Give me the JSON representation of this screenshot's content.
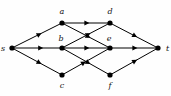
{
  "figure": {
    "name": "directed-flow-network-graph",
    "type": "directed-graph",
    "width": 171,
    "height": 96,
    "background_color": "#fefefe",
    "node_color": "#000000",
    "edge_color": "#000000",
    "label_color": "#111111",
    "node_radius": 2.6,
    "edge_width": 1.0,
    "label_style": "italic-serif"
  },
  "nodes": [
    {
      "id": "s",
      "label": "s",
      "x": 12,
      "y": 48,
      "label_x": 5,
      "label_y": 51,
      "label_pos": "left"
    },
    {
      "id": "a",
      "label": "a",
      "x": 62,
      "y": 23,
      "label_x": 62,
      "label_y": 14,
      "label_pos": "above"
    },
    {
      "id": "b",
      "label": "b",
      "x": 62,
      "y": 48,
      "label_x": 61,
      "label_y": 41,
      "label_pos": "above"
    },
    {
      "id": "c",
      "label": "c",
      "x": 62,
      "y": 75,
      "label_x": 62,
      "label_y": 88,
      "label_pos": "below"
    },
    {
      "id": "d",
      "label": "d",
      "x": 110,
      "y": 23,
      "label_x": 110,
      "label_y": 14,
      "label_pos": "above"
    },
    {
      "id": "e",
      "label": "e",
      "x": 110,
      "y": 48,
      "label_x": 109,
      "label_y": 41,
      "label_pos": "above"
    },
    {
      "id": "f",
      "label": "f",
      "x": 110,
      "y": 75,
      "label_x": 110,
      "label_y": 88,
      "label_pos": "below"
    },
    {
      "id": "t",
      "label": "t",
      "x": 158,
      "y": 48,
      "label_x": 166,
      "label_y": 51,
      "label_pos": "right"
    }
  ],
  "edges": [
    {
      "from": "s",
      "to": "a",
      "x1": 12,
      "y1": 48,
      "x2": 62,
      "y2": 23,
      "arrow_at": 0.55
    },
    {
      "from": "s",
      "to": "b",
      "x1": 12,
      "y1": 48,
      "x2": 62,
      "y2": 48,
      "arrow_at": 0.58
    },
    {
      "from": "s",
      "to": "c",
      "x1": 12,
      "y1": 48,
      "x2": 62,
      "y2": 75,
      "arrow_at": 0.55
    },
    {
      "from": "a",
      "to": "d",
      "x1": 62,
      "y1": 23,
      "x2": 110,
      "y2": 23,
      "arrow_at": 0.52
    },
    {
      "from": "a",
      "to": "e",
      "x1": 62,
      "y1": 23,
      "x2": 110,
      "y2": 48,
      "arrow_at": 0.55
    },
    {
      "from": "b",
      "to": "d",
      "x1": 62,
      "y1": 48,
      "x2": 110,
      "y2": 23,
      "arrow_at": 0.55
    },
    {
      "from": "b",
      "to": "e",
      "x1": 62,
      "y1": 48,
      "x2": 110,
      "y2": 48,
      "arrow_at": 0.52
    },
    {
      "from": "b",
      "to": "f",
      "x1": 62,
      "y1": 48,
      "x2": 110,
      "y2": 75,
      "arrow_at": 0.55
    },
    {
      "from": "c",
      "to": "e",
      "x1": 62,
      "y1": 75,
      "x2": 110,
      "y2": 48,
      "arrow_at": 0.45
    },
    {
      "from": "d",
      "to": "t",
      "x1": 110,
      "y1": 23,
      "x2": 158,
      "y2": 48,
      "arrow_at": 0.52
    },
    {
      "from": "e",
      "to": "t",
      "x1": 110,
      "y1": 48,
      "x2": 158,
      "y2": 48,
      "arrow_at": 0.52
    },
    {
      "from": "f",
      "to": "t",
      "x1": 110,
      "y1": 75,
      "x2": 158,
      "y2": 48,
      "arrow_at": 0.52
    }
  ]
}
